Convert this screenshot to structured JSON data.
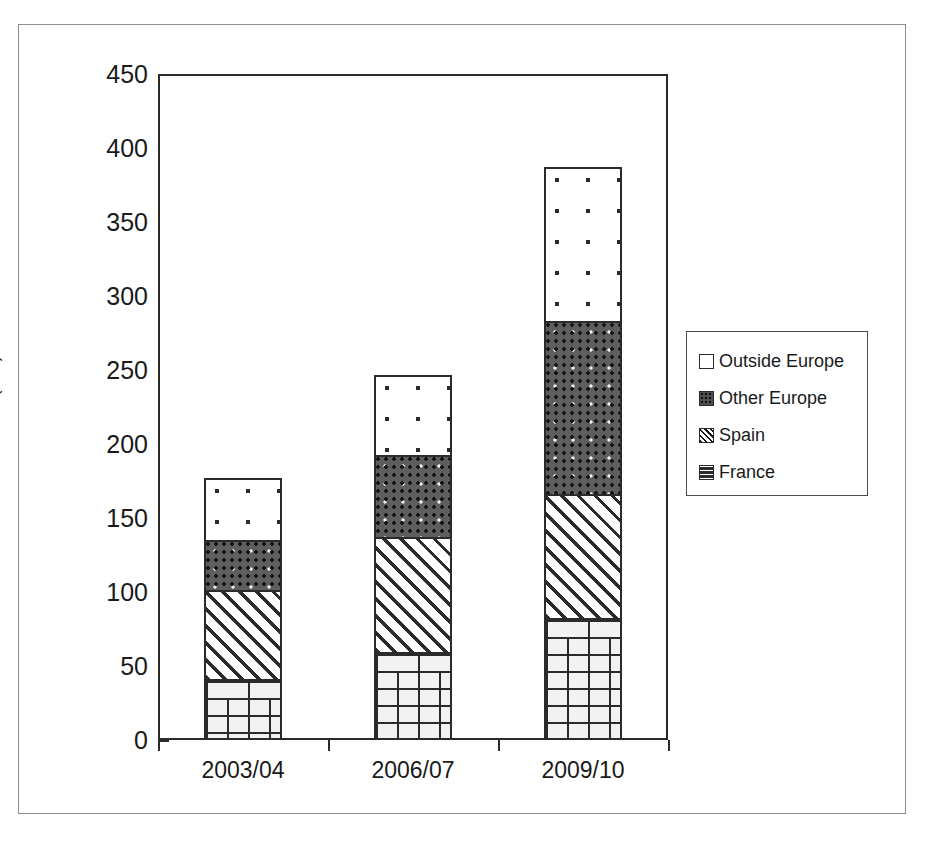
{
  "chart_data": {
    "type": "bar",
    "stacked": true,
    "title": "",
    "xlabel": "",
    "ylabel": "Second homes (000)",
    "categories": [
      "2003/04",
      "2006/07",
      "2009/10"
    ],
    "ylim": [
      0,
      450
    ],
    "ytick_step": 50,
    "yticks": [
      "450",
      "400",
      "350",
      "300",
      "250",
      "200",
      "150",
      "100",
      "50",
      "0"
    ],
    "grid": false,
    "legend_position": "right",
    "series": [
      {
        "name": "France",
        "pattern": "brick",
        "values": [
          40,
          58,
          81
        ]
      },
      {
        "name": "Spain",
        "pattern": "diagonal-hatch",
        "values": [
          60,
          78,
          84
        ]
      },
      {
        "name": "Other Europe",
        "pattern": "dense-dots",
        "values": [
          34,
          55,
          117
        ]
      },
      {
        "name": "Outside Europe",
        "pattern": "sparse-dots",
        "values": [
          42,
          54,
          104
        ]
      }
    ],
    "totals": [
      176,
      245,
      386
    ],
    "colors": {
      "axis": "#2b2b2b",
      "text": "#1a1a1a",
      "frame": "#8d8d8d"
    }
  },
  "legend": {
    "items": [
      {
        "label": "Outside Europe"
      },
      {
        "label": "Other Europe"
      },
      {
        "label": "Spain"
      },
      {
        "label": "France"
      }
    ]
  }
}
